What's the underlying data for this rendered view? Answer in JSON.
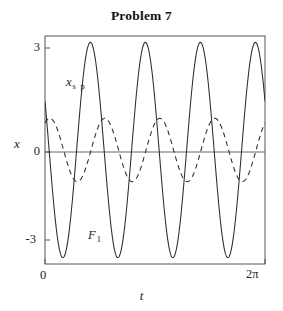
{
  "title": "Problem 7",
  "axes": {
    "xlabel": "t",
    "ylabel": "x",
    "yticks": [
      "3",
      "0",
      "-3"
    ],
    "xticks": [
      "0",
      "2π"
    ]
  },
  "annotations": {
    "xsp": {
      "name": "x",
      "sub": "s p"
    },
    "f1": {
      "name": "F",
      "sub": "1"
    }
  },
  "colors": {
    "curve": "#2b2b2b",
    "frame": "#555555",
    "zero_line": "#666666",
    "background": "#ffffff"
  },
  "chart_data": {
    "type": "line",
    "title": "Problem 7",
    "xlabel": "t",
    "ylabel": "x",
    "xlim": [
      0,
      6.283185307179586
    ],
    "ylim": [
      -3.6,
      3.6
    ],
    "xtick_values": [
      0,
      6.283185307179586
    ],
    "xtick_labels": [
      "0",
      "2π"
    ],
    "ytick_values": [
      3,
      0,
      -3
    ],
    "ytick_labels": [
      "3",
      "0",
      "-3"
    ],
    "grid": false,
    "legend": "inline-annotations",
    "series": [
      {
        "name": "F 1",
        "label": "F₁",
        "style": "solid",
        "amplitude": 3.4,
        "cycles": 4,
        "angular_frequency": 4,
        "phase": 1.1,
        "formula": "3.4*cos(4*t + 1.1)",
        "annotation_at": [
          1.15,
          -3.0
        ]
      },
      {
        "name": "x s p",
        "label": "x_sp",
        "style": "dashed",
        "amplitude": 1.0,
        "cycles": 4,
        "angular_frequency": 4,
        "phase": -0.55,
        "formula": "1.0*cos(4*t - 0.55)",
        "annotation_at": [
          0.6,
          2.1
        ]
      }
    ]
  }
}
